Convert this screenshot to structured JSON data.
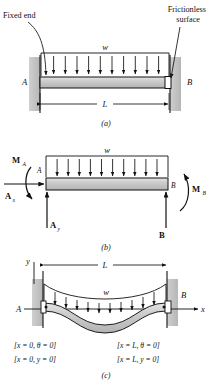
{
  "figure": {
    "background_color": "#ffffff",
    "line_color": "#111111",
    "wall_fill": "#bfbfbf",
    "beam_fill": "#c8c8c8",
    "slider_fill": "#ffffff"
  },
  "panel_a": {
    "tag": "(a)",
    "annotations": {
      "fixed_end": "Fixed end",
      "frictionless_1": "Frictionless",
      "frictionless_2": "surface"
    },
    "load_label": "w",
    "node_left": "A",
    "node_right": "B",
    "dimension_label": "L",
    "arrow_count": 11
  },
  "panel_b": {
    "tag": "(b)",
    "load_label": "w",
    "node_left": "A",
    "node_right": "B",
    "moment_left": "M",
    "moment_left_sub": "A",
    "moment_right": "M",
    "moment_right_sub": "B",
    "reaction_ax": "A",
    "reaction_ax_sub": "x",
    "reaction_ay": "A",
    "reaction_ay_sub": "y",
    "reaction_b": "B",
    "arrow_count": 11
  },
  "panel_c": {
    "tag": "(c)",
    "axis_y": "y",
    "axis_x": "x",
    "dimension_label": "L",
    "load_label": "w",
    "node_left": "A",
    "node_right": "B",
    "boundary_conditions_left": [
      "[x = 0, θ = 0]",
      "[x = 0, y = 0]"
    ],
    "boundary_conditions_right": [
      "[x = L, θ = 0]",
      "[x = L, y = 0]"
    ],
    "arrow_count": 11
  }
}
